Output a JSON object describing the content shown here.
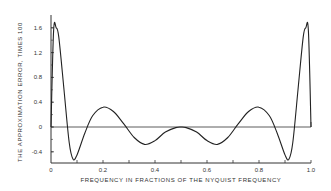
{
  "chart_data": {
    "type": "line",
    "title": "",
    "xlabel": "FREQUENCY IN FRACTIONS OF THE NYQUIST FREQUENCY",
    "ylabel": "THE APPROXIMATION ERROR, TIMES 100",
    "xlim": [
      0,
      1.0
    ],
    "ylim": [
      -0.56,
      1.75
    ],
    "x_ticks": [
      "0",
      "0.2",
      "0.4",
      "0.6",
      "0.8",
      "1.0"
    ],
    "y_ticks": [
      "1.6",
      "1.2",
      "0.8",
      "0.4",
      "0",
      "-0.4"
    ],
    "grid": false,
    "legend": null,
    "series": [
      {
        "name": "approximation error",
        "x": [
          0.0,
          0.01,
          0.02,
          0.03,
          0.05,
          0.07,
          0.085,
          0.1,
          0.13,
          0.16,
          0.2,
          0.24,
          0.28,
          0.32,
          0.36,
          0.4,
          0.44,
          0.48,
          0.5,
          0.52,
          0.56,
          0.6,
          0.64,
          0.68,
          0.72,
          0.76,
          0.8,
          0.84,
          0.87,
          0.9,
          0.915,
          0.93,
          0.95,
          0.97,
          0.98,
          0.99,
          1.0
        ],
        "values": [
          0.0,
          1.55,
          1.6,
          1.45,
          0.6,
          -0.25,
          -0.52,
          -0.45,
          -0.1,
          0.18,
          0.32,
          0.25,
          0.05,
          -0.17,
          -0.28,
          -0.22,
          -0.08,
          -0.01,
          0.0,
          -0.01,
          -0.08,
          -0.22,
          -0.28,
          -0.17,
          0.05,
          0.25,
          0.32,
          0.18,
          -0.1,
          -0.45,
          -0.52,
          -0.25,
          0.6,
          1.45,
          1.6,
          1.55,
          0.0
        ]
      }
    ],
    "reference_line": {
      "y": 0
    }
  }
}
